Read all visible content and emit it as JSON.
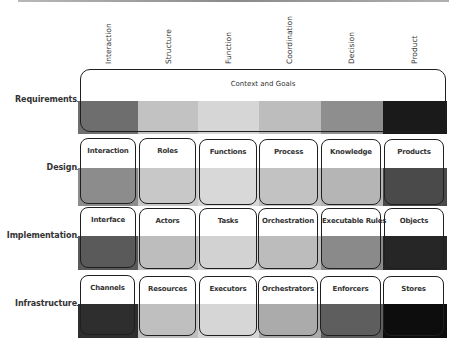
{
  "columns": [
    {
      "label": "Interaction"
    },
    {
      "label": "Structure"
    },
    {
      "label": "Function"
    },
    {
      "label": "Coordination"
    },
    {
      "label": "Decision"
    },
    {
      "label": "Product"
    }
  ],
  "rows": [
    {
      "label": "Requirements",
      "span_label": "Context and Goals",
      "shades": [
        "#6e6e6e",
        "#c2c2c2",
        "#d6d6d6",
        "#bdbdbd",
        "#8e8e8e",
        "#1a1a1a"
      ]
    },
    {
      "label": "Design",
      "cells": [
        "Interaction",
        "Roles",
        "Functions",
        "Process",
        "Knowledge",
        "Products"
      ],
      "shades": [
        "#8c8c8c",
        "#c8c8c8",
        "#d8d8d8",
        "#c2c2c2",
        "#b5b5b5",
        "#4a4a4a"
      ]
    },
    {
      "label": "Implementation",
      "cells": [
        "Interface",
        "Actors",
        "Tasks",
        "Orchestration",
        "Executable Rules",
        "Objects"
      ],
      "shades": [
        "#5a5a5a",
        "#bdbdbd",
        "#d2d2d2",
        "#bcbcbc",
        "#8a8a8a",
        "#262626"
      ]
    },
    {
      "label": "Infrastructure",
      "cells": [
        "Channels",
        "Resources",
        "Executors",
        "Orchestrators",
        "Enforcers",
        "Stores"
      ],
      "shades": [
        "#2e2e2e",
        "#bfbfbf",
        "#d6d6d6",
        "#ababab",
        "#5e5e5e",
        "#0d0d0d"
      ]
    }
  ]
}
